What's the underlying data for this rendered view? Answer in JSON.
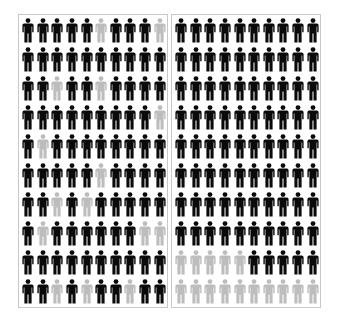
{
  "colors": {
    "filled": "#0a0a0a",
    "empty": "#bdbdbd",
    "border": "#c8c8c8",
    "background": "#ffffff"
  },
  "icon": "person-icon",
  "panels": [
    {
      "name": "left-panel",
      "arrangement": "scattered",
      "rows": 10,
      "cols": 10,
      "filled_count": 85,
      "empty_count": 15,
      "grid": [
        [
          1,
          1,
          1,
          1,
          1,
          0,
          1,
          1,
          1,
          0
        ],
        [
          1,
          1,
          1,
          1,
          1,
          1,
          1,
          1,
          1,
          1
        ],
        [
          1,
          1,
          0,
          1,
          1,
          0,
          1,
          1,
          1,
          1
        ],
        [
          1,
          1,
          1,
          1,
          1,
          1,
          1,
          1,
          1,
          0
        ],
        [
          1,
          0,
          1,
          1,
          1,
          1,
          1,
          1,
          1,
          1
        ],
        [
          1,
          1,
          1,
          1,
          1,
          0,
          1,
          1,
          1,
          1
        ],
        [
          1,
          1,
          0,
          1,
          0,
          1,
          1,
          1,
          1,
          1
        ],
        [
          1,
          0,
          1,
          1,
          1,
          1,
          1,
          1,
          0,
          0
        ],
        [
          1,
          1,
          1,
          1,
          1,
          1,
          1,
          1,
          1,
          1
        ],
        [
          1,
          1,
          0,
          1,
          0,
          1,
          1,
          0,
          1,
          1
        ]
      ]
    },
    {
      "name": "right-panel",
      "arrangement": "grouped",
      "rows": 10,
      "cols": 10,
      "filled_count": 85,
      "empty_count": 15,
      "grid": [
        [
          1,
          1,
          1,
          1,
          1,
          1,
          1,
          1,
          1,
          1
        ],
        [
          1,
          1,
          1,
          1,
          1,
          1,
          1,
          1,
          1,
          1
        ],
        [
          1,
          1,
          1,
          1,
          1,
          1,
          1,
          1,
          1,
          1
        ],
        [
          1,
          1,
          1,
          1,
          1,
          1,
          1,
          1,
          1,
          1
        ],
        [
          1,
          1,
          1,
          1,
          1,
          1,
          1,
          1,
          1,
          1
        ],
        [
          1,
          1,
          1,
          1,
          1,
          1,
          1,
          1,
          1,
          1
        ],
        [
          1,
          1,
          1,
          1,
          1,
          1,
          1,
          1,
          1,
          1
        ],
        [
          1,
          1,
          1,
          1,
          1,
          1,
          1,
          1,
          1,
          1
        ],
        [
          0,
          0,
          0,
          0,
          0,
          1,
          1,
          1,
          1,
          1
        ],
        [
          0,
          0,
          0,
          0,
          0,
          0,
          0,
          0,
          0,
          0
        ]
      ]
    }
  ]
}
